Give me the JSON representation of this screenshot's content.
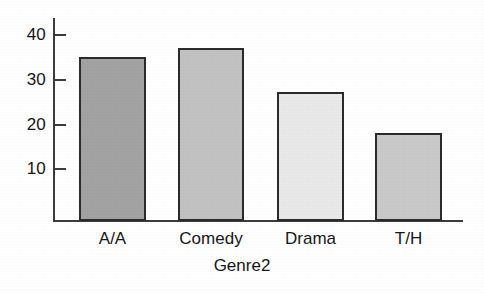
{
  "chart_data": {
    "type": "bar",
    "title": "",
    "xlabel": "Genre2",
    "ylabel": "",
    "categories": [
      "A/A",
      "Comedy",
      "Drama",
      "T/H"
    ],
    "values": [
      35,
      37,
      27,
      18
    ],
    "ytick_labels": [
      "40",
      "30",
      "20",
      "10"
    ],
    "yticks": [
      40,
      30,
      20,
      10
    ],
    "ylim": [
      0,
      43
    ],
    "grid": false,
    "legend": false,
    "bar_colors": [
      "#a3a3a3",
      "#c2c2c2",
      "#e9e9e9",
      "#c9c9c9"
    ],
    "bar_border_color": "#2b2b2b",
    "axis_color": "#3d3d3d",
    "background_color": "#ffffff"
  },
  "axis": {
    "y": {
      "ticks": [
        {
          "label": "40",
          "value": 40
        },
        {
          "label": "30",
          "value": 30
        },
        {
          "label": "20",
          "value": 20
        },
        {
          "label": "10",
          "value": 10
        }
      ]
    },
    "x": {
      "title": "Genre2",
      "categories": [
        {
          "label": "A/A",
          "value": 35
        },
        {
          "label": "Comedy",
          "value": 37
        },
        {
          "label": "Drama",
          "value": 27
        },
        {
          "label": "T/H",
          "value": 18
        }
      ]
    }
  }
}
